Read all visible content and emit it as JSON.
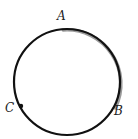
{
  "diagram": {
    "type": "circle-with-arc",
    "circle": {
      "cx": 67,
      "cy": 82,
      "r": 53,
      "stroke": "#111111",
      "stroke_width": 2.2
    },
    "highlighted_arc": {
      "from": "A",
      "to": "B",
      "direction": "clockwise",
      "color": "#9a9a9a"
    },
    "points": [
      {
        "name": "A",
        "label": "A",
        "x": 64,
        "y": 29,
        "label_x": 57,
        "label_y": 20,
        "dot": false
      },
      {
        "name": "B",
        "label": "B",
        "x": 112,
        "y": 108,
        "label_x": 114,
        "label_y": 115,
        "dot": false
      },
      {
        "name": "C",
        "label": "C",
        "x": 21,
        "y": 106,
        "label_x": 5,
        "label_y": 112,
        "dot": true
      }
    ]
  }
}
